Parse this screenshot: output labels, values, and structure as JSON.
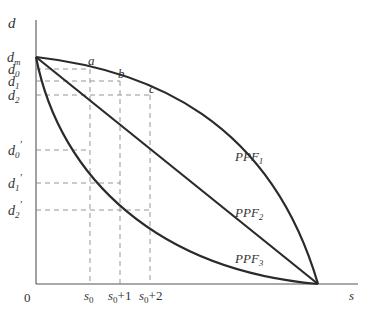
{
  "figure": {
    "axes": {
      "y_label": "d",
      "x_label": "s",
      "origin_label": "0"
    },
    "y_ticks": [
      {
        "base": "d",
        "sub": "m",
        "prime": ""
      },
      {
        "base": "d",
        "sub": "0",
        "prime": ""
      },
      {
        "base": "d",
        "sub": "1",
        "prime": ""
      },
      {
        "base": "d",
        "sub": "2",
        "prime": ""
      },
      {
        "base": "d",
        "sub": "0",
        "prime": "′"
      },
      {
        "base": "d",
        "sub": "1",
        "prime": "′"
      },
      {
        "base": "d",
        "sub": "2",
        "prime": "′"
      }
    ],
    "x_ticks": [
      {
        "base": "s",
        "sub": "0",
        "suffix": ""
      },
      {
        "base": "s",
        "sub": "0",
        "suffix": "+1"
      },
      {
        "base": "s",
        "sub": "0",
        "suffix": "+2"
      }
    ],
    "points": [
      "a",
      "b",
      "c"
    ],
    "curves": [
      {
        "base": "PPF",
        "sub": "1",
        "shape": "concave"
      },
      {
        "base": "PPF",
        "sub": "2",
        "shape": "linear"
      },
      {
        "base": "PPF",
        "sub": "3",
        "shape": "convex"
      }
    ],
    "colors": {
      "curve": "#2a2a2a",
      "axis": "#555555",
      "dash": "#8a8a8a",
      "text": "#333333"
    }
  }
}
